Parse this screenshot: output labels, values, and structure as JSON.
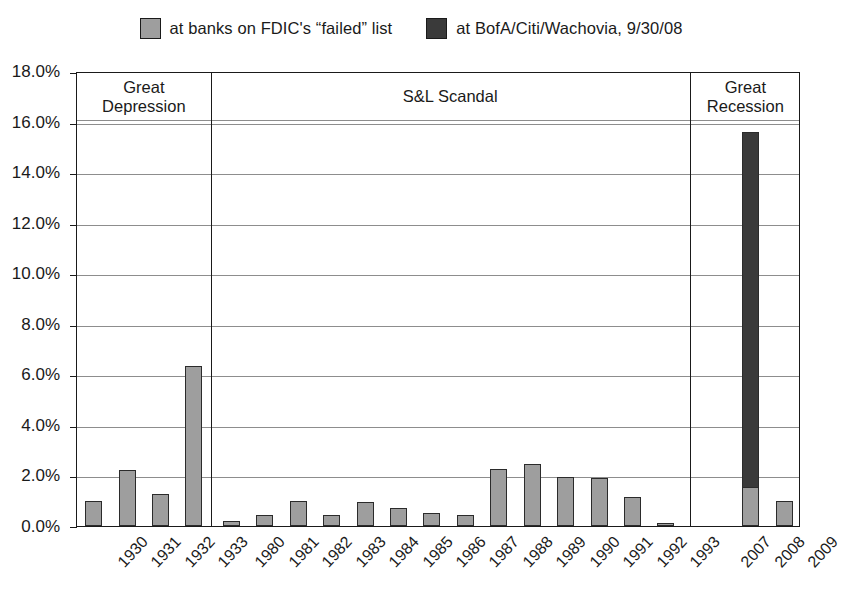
{
  "chart_data": {
    "type": "bar",
    "title": "",
    "subtitle": "",
    "xlabel": "",
    "ylabel": "",
    "ylim": [
      0,
      18
    ],
    "ytick_step": 2,
    "ytick_labels": [
      "0.0%",
      "2.0%",
      "4.0%",
      "6.0%",
      "8.0%",
      "10.0%",
      "12.0%",
      "14.0%",
      "16.0%",
      "18.0%"
    ],
    "grid": true,
    "stacked": true,
    "legend_position": "top-center",
    "categories": [
      "1930",
      "1931",
      "1932",
      "1933",
      "1980",
      "1981",
      "1982",
      "1983",
      "1984",
      "1985",
      "1986",
      "1987",
      "1988",
      "1989",
      "1990",
      "1991",
      "1992",
      "1993",
      "2007",
      "2008",
      "2009"
    ],
    "series": [
      {
        "name": "at banks on FDIC's “failed” list",
        "color": "#9e9e9e",
        "values": [
          1.0,
          2.2,
          1.25,
          6.35,
          0.2,
          0.45,
          1.0,
          0.45,
          0.95,
          0.7,
          0.5,
          0.45,
          2.25,
          2.45,
          1.95,
          1.9,
          1.15,
          0.1,
          0,
          1.55,
          1.0
        ]
      },
      {
        "name": "at BofA/Citi/Wachovia, 9/30/08",
        "color": "#3a3a3a",
        "values": [
          0,
          0,
          0,
          0,
          0,
          0,
          0,
          0,
          0,
          0,
          0,
          0,
          0,
          0,
          0,
          0,
          0,
          0,
          0,
          14.05,
          0
        ]
      }
    ],
    "annotations": [
      {
        "name": "great-depression",
        "label_lines": [
          "Great",
          "Depression"
        ],
        "span": [
          "1930",
          "1933"
        ]
      },
      {
        "name": "sl-scandal",
        "label_lines": [
          "S&L Scandal"
        ],
        "span": [
          "1980",
          "1993"
        ]
      },
      {
        "name": "great-recession",
        "label_lines": [
          "Great",
          "Recession"
        ],
        "span": [
          "2007",
          "2009"
        ]
      }
    ]
  },
  "legend": {
    "items": [
      {
        "label": "at banks on FDIC's “failed” list",
        "color": "#9e9e9e"
      },
      {
        "label": "at BofA/Citi/Wachovia, 9/30/08",
        "color": "#3a3a3a"
      }
    ]
  }
}
